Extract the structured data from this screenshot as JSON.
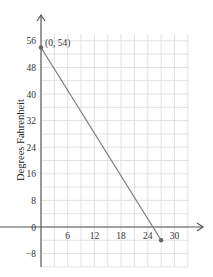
{
  "chart_data": {
    "type": "line",
    "title": "",
    "xlabel": "",
    "ylabel": "Degrees Fahrenheit",
    "xlim": [
      0,
      33
    ],
    "ylim": [
      -12,
      60
    ],
    "x_ticks": [
      6,
      12,
      18,
      24,
      30
    ],
    "y_ticks": [
      56,
      48,
      40,
      32,
      24,
      16,
      8,
      0,
      -8
    ],
    "grid": true,
    "grid_minor_x_step": 3,
    "grid_minor_y_step": 4,
    "series": [
      {
        "name": "temperature",
        "points": [
          [
            0,
            54
          ],
          [
            27,
            -4
          ]
        ],
        "color": "#777777"
      }
    ],
    "annotations": [
      {
        "text": "(0, 54)",
        "x": 0,
        "y": 54
      }
    ],
    "legend": null
  },
  "labels": {
    "ylabel": "Degrees Fahrenheit",
    "point_annotation": "(0, 54)",
    "x_ticks": [
      "6",
      "12",
      "18",
      "24",
      "30"
    ],
    "y_ticks": [
      "56",
      "48",
      "40",
      "32",
      "24",
      "16",
      "8",
      "0",
      "−8"
    ]
  },
  "colors": {
    "grid": "#d9d9d9",
    "axis": "#555555",
    "line": "#7a7a7a",
    "point": "#666666"
  }
}
